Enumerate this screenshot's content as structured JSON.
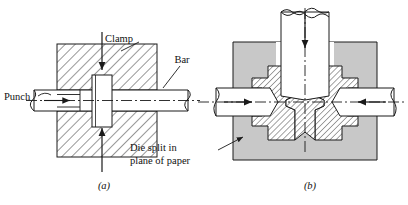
{
  "figure": {
    "background_color": "#ffffff",
    "line_color": "#1a1a1a",
    "die_fill_color": "#c8c8c8",
    "part_fill_color": "#ffffff"
  },
  "panel_a": {
    "caption": "(a)",
    "labels": {
      "clamp": "Clamp",
      "bar": "Bar",
      "punch": "Punch"
    },
    "arrows": {
      "clamp_down": "down-arrow",
      "clamp_up": "up-arrow",
      "punch_right": "right-arrow"
    }
  },
  "panel_b": {
    "caption": "(b)",
    "labels": {
      "die_split_line1": "Die split in",
      "die_split_line2": "plane of paper"
    },
    "arrows": {
      "punch_down": "down-arrow",
      "left_in": "right-arrow",
      "right_in": "left-arrow"
    }
  }
}
